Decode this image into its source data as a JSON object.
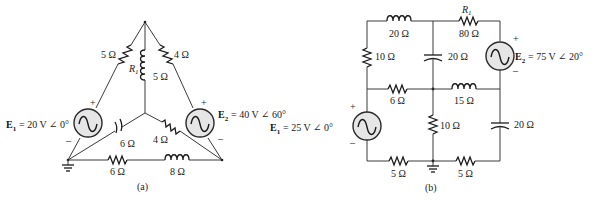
{
  "figure": {
    "circuit_a": {
      "caption": "(a)",
      "sources": [
        {
          "id": "E1",
          "name": "E",
          "sub": "1",
          "value": "= 20 V ∠ 0°",
          "plus": "+",
          "minus": "–"
        },
        {
          "id": "E2",
          "name": "E",
          "sub": "2",
          "value": "= 40 V ∠ 60°",
          "plus": "+",
          "minus": "–"
        }
      ],
      "components": {
        "left_top_resistor": "5 Ω",
        "right_top_resistor": "4 Ω",
        "center_inductor": "5 Ω",
        "center_inductor_name": "R",
        "center_inductor_sub": "1",
        "capacitor": "6 Ω",
        "right_inner_resistor": "4 Ω",
        "bottom_resistor": "6 Ω",
        "bottom_inductor": "8 Ω"
      }
    },
    "circuit_b": {
      "caption": "(b)",
      "sources": [
        {
          "id": "E1",
          "name": "E",
          "sub": "1",
          "value": "= 25 V ∠ 0°",
          "plus": "+",
          "minus": "–"
        },
        {
          "id": "E2",
          "name": "E",
          "sub": "2",
          "value": "= 75 V ∠ 20°",
          "plus": "+",
          "minus": "–"
        }
      ],
      "components": {
        "top_inductor": "20 Ω",
        "top_resistor": "80 Ω",
        "top_resistor_name": "R",
        "top_resistor_sub": "1",
        "left_resistor": "10 Ω",
        "center_capacitor": "20 Ω",
        "mid_resistor": "6 Ω",
        "mid_inductor": "15 Ω",
        "center_vertical_resistor": "10 Ω",
        "right_capacitor": "20 Ω",
        "bottom_left_resistor": "5 Ω",
        "bottom_right_resistor": "5 Ω"
      }
    }
  }
}
